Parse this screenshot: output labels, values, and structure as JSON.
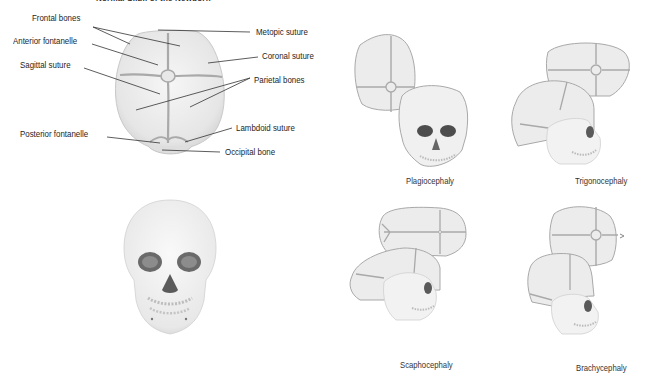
{
  "title": "Normal Skull of the Newborn",
  "anatomy": {
    "labels_left": {
      "frontal_bones": "Frontal bones",
      "anterior_fontanelle": "Anterior fontanelle",
      "sagittal_suture": "Sagittal suture",
      "posterior_fontanelle": "Posterior fontanelle"
    },
    "labels_right": {
      "metopic_suture": "Metopic suture",
      "coronal_suture": "Coronal suture",
      "parietal_bones": "Parietal bones",
      "lambdoid_suture": "Lambdoid suture",
      "occipital_bone": "Occipital bone"
    }
  },
  "conditions": [
    {
      "id": "plagiocephaly",
      "caption": "Plagiocephaly"
    },
    {
      "id": "trigonocephaly",
      "caption": "Trigonocephaly"
    },
    {
      "id": "scaphocephaly",
      "caption": "Scaphocephaly"
    },
    {
      "id": "brachycephaly",
      "caption": "Brachycephaly"
    }
  ],
  "colors": {
    "bone_fill": "#ebebeb",
    "suture": "#a9a9a9",
    "outline": "#b5b5b5",
    "leader": "#333333",
    "orbit": "#555555"
  }
}
